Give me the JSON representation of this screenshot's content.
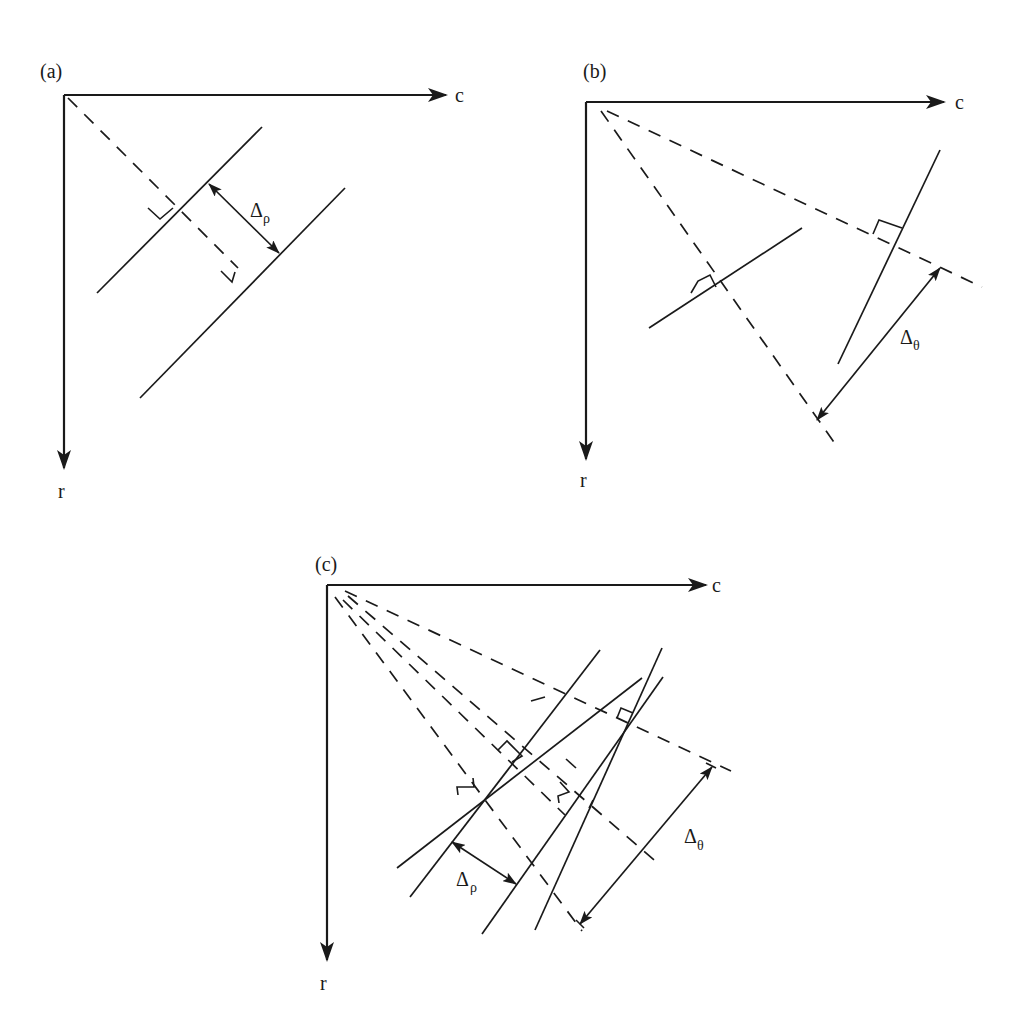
{
  "figure": {
    "panels": [
      {
        "id": "a",
        "label": "(a)",
        "x_axis_label": "c",
        "y_axis_label": "r",
        "delta_symbol": "Δ",
        "delta_subscript": "ρ",
        "description": "Two parallel lines with same θ, offset by Δρ along the normal from the origin"
      },
      {
        "id": "b",
        "label": "(b)",
        "x_axis_label": "c",
        "y_axis_label": "r",
        "delta_symbol": "Δ",
        "delta_subscript": "θ",
        "description": "Two lines with same ρ but different θ, normals differ by Δθ"
      },
      {
        "id": "c",
        "label": "(c)",
        "x_axis_label": "c",
        "y_axis_label": "r",
        "delta_rho_symbol": "Δ",
        "delta_rho_subscript": "ρ",
        "delta_theta_symbol": "Δ",
        "delta_theta_subscript": "θ",
        "description": "Combined variation in both ρ and θ"
      }
    ],
    "colors": {
      "ink": "#1a1a1a",
      "background": "#ffffff"
    }
  }
}
